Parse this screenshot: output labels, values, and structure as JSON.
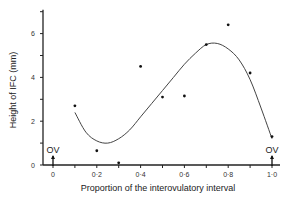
{
  "chart_data": {
    "type": "scatter",
    "title": "",
    "xlabel": "Proportion of the interovulatory interval",
    "ylabel": "Height of IFC (mm)",
    "xlim": [
      0,
      1.0
    ],
    "ylim": [
      0,
      7
    ],
    "x_ticks": [
      0,
      0.1,
      0.2,
      0.3,
      0.4,
      0.5,
      0.6,
      0.7,
      0.8,
      0.9,
      1.0
    ],
    "x_tick_labels": [
      "0",
      "",
      "0·2",
      "",
      "0·4",
      "",
      "0·6",
      "",
      "0·8",
      "",
      "1·0"
    ],
    "y_ticks": [
      0,
      1,
      2,
      3,
      4,
      5,
      6,
      7
    ],
    "y_tick_labels": [
      "0",
      "",
      "2",
      "",
      "4",
      "",
      "6",
      ""
    ],
    "grid": false,
    "legend": null,
    "series": [
      {
        "name": "observed",
        "style": "points",
        "x": [
          0.1,
          0.2,
          0.3,
          0.4,
          0.5,
          0.6,
          0.7,
          0.8,
          0.9,
          1.0
        ],
        "y": [
          2.7,
          0.65,
          0.1,
          4.5,
          3.1,
          3.15,
          5.5,
          6.4,
          4.2,
          1.3
        ]
      },
      {
        "name": "fitted curve",
        "style": "smooth-line",
        "x": [
          0.1,
          0.15,
          0.2,
          0.25,
          0.3,
          0.35,
          0.4,
          0.45,
          0.5,
          0.55,
          0.6,
          0.65,
          0.7,
          0.75,
          0.8,
          0.85,
          0.9,
          0.95,
          1.0
        ],
        "y": [
          2.4,
          1.5,
          1.1,
          1.0,
          1.2,
          1.6,
          2.2,
          2.8,
          3.4,
          4.0,
          4.6,
          5.1,
          5.5,
          5.55,
          5.3,
          4.8,
          3.9,
          2.6,
          1.2
        ]
      }
    ],
    "annotations": [
      {
        "text": "OV",
        "x": 0.0,
        "type": "ovulation-arrow"
      },
      {
        "text": "OV",
        "x": 1.0,
        "type": "ovulation-arrow"
      }
    ]
  },
  "labels": {
    "xlabel": "Proportion of the interovulatory interval",
    "ylabel": "Height of IFC (mm)",
    "ov_left": "OV",
    "ov_right": "OV"
  }
}
